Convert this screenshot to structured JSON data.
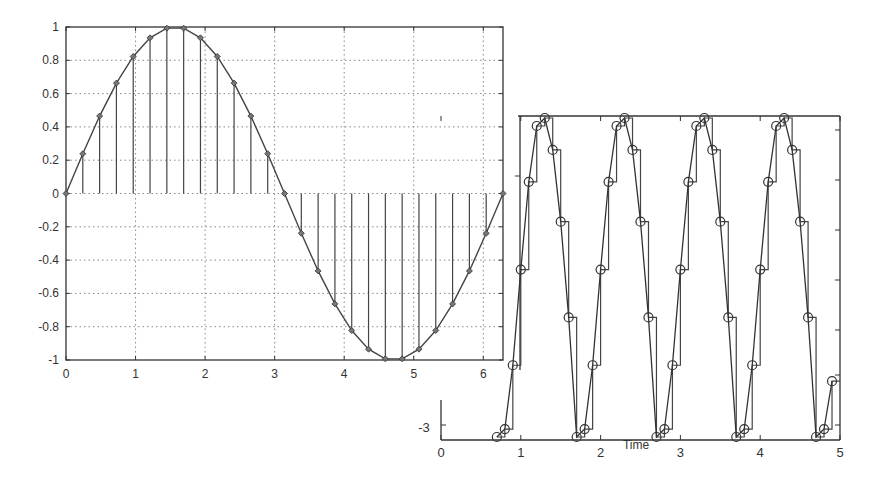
{
  "chart_data": [
    {
      "id": "left",
      "type": "line",
      "subtype": "stem+line (sampled sine)",
      "title": "",
      "xlabel": "",
      "ylabel": "",
      "xlim": [
        0,
        6.2832
      ],
      "ylim": [
        -1,
        1
      ],
      "grid": true,
      "xticks": [
        "0",
        "1",
        "2",
        "3",
        "4",
        "5",
        "6"
      ],
      "yticks": [
        "1",
        "0.8",
        "0.6",
        "0.4",
        "0.2",
        "0",
        "-0.2",
        "-0.4",
        "-0.6",
        "-0.8",
        "-1"
      ],
      "series": [
        {
          "name": "sin(x) samples",
          "x": [
            0,
            0.2417,
            0.4833,
            0.725,
            0.9666,
            1.2083,
            1.45,
            1.6916,
            1.9333,
            2.1749,
            2.4166,
            2.6583,
            2.8999,
            3.1416,
            3.3833,
            3.6249,
            3.8666,
            4.1082,
            4.3499,
            4.5916,
            4.8332,
            5.0749,
            5.3165,
            5.5582,
            5.7999,
            6.0415,
            6.2832
          ],
          "values": [
            0,
            0.239,
            0.465,
            0.663,
            0.823,
            0.935,
            0.993,
            0.993,
            0.935,
            0.823,
            0.663,
            0.465,
            0.239,
            0,
            -0.239,
            -0.465,
            -0.663,
            -0.823,
            -0.935,
            -0.993,
            -0.993,
            -0.935,
            -0.823,
            -0.663,
            -0.465,
            -0.239,
            0
          ]
        }
      ],
      "markers": "diamond"
    },
    {
      "id": "right",
      "type": "line",
      "subtype": "sampled sine with zero-order hold (staircase) and circle markers",
      "title": "",
      "xlabel": "Time",
      "ylabel": "",
      "xlim": [
        0,
        5
      ],
      "ylim_visible_label": "-3",
      "grid": false,
      "xticks": [
        "0",
        "1",
        "2",
        "3",
        "4",
        "5"
      ],
      "yticks": [
        "-3"
      ],
      "period": 1,
      "sample_interval": 0.1,
      "series": [
        {
          "name": "sampled signal (approx, normalized)",
          "x": [
            0.7,
            0.8,
            0.9,
            1.0,
            1.1,
            1.2,
            1.3,
            1.4,
            1.5,
            1.6,
            1.7,
            1.8,
            1.9,
            2.0,
            2.1,
            2.2,
            2.3,
            2.4,
            2.5,
            2.6,
            2.7,
            2.8,
            2.9,
            3.0,
            3.1,
            3.2,
            3.3,
            3.4,
            3.5,
            3.6,
            3.7,
            3.8,
            3.9,
            4.0,
            4.1,
            4.2,
            4.3,
            4.4,
            4.5,
            4.6,
            4.7,
            4.8,
            4.9
          ],
          "values": [
            -1.0,
            -0.95,
            -0.55,
            0.05,
            0.6,
            0.95,
            1.0,
            0.8,
            0.35,
            -0.25,
            -1.0,
            -0.95,
            -0.55,
            0.05,
            0.6,
            0.95,
            1.0,
            0.8,
            0.35,
            -0.25,
            -1.0,
            -0.95,
            -0.55,
            0.05,
            0.6,
            0.95,
            1.0,
            0.8,
            0.35,
            -0.25,
            -1.0,
            -0.95,
            -0.55,
            0.05,
            0.6,
            0.95,
            1.0,
            0.8,
            0.35,
            -0.25,
            -1.0,
            -0.95,
            -0.65
          ]
        }
      ],
      "markers": "circle"
    }
  ],
  "colors": {
    "line": "#444444",
    "axis": "#333333",
    "grid": "#888888",
    "background": "#ffffff"
  }
}
